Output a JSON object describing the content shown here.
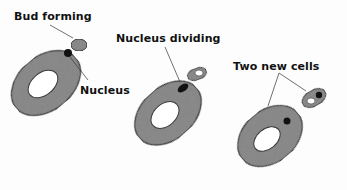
{
  "diagram": {
    "colors": {
      "cytoplasm": "#8e8e8e",
      "cytoplasm_edge": "#3a3a3a",
      "vacuole": "#ffffff",
      "nucleus": "#111111",
      "leader_line": "#333333"
    },
    "stages": [
      {
        "id": "stage-1",
        "labels": [
          "Bud forming",
          "Nucleus"
        ]
      },
      {
        "id": "stage-2",
        "labels": [
          "Nucleus dividing"
        ]
      },
      {
        "id": "stage-3",
        "labels": [
          "Two new cells"
        ]
      }
    ]
  }
}
